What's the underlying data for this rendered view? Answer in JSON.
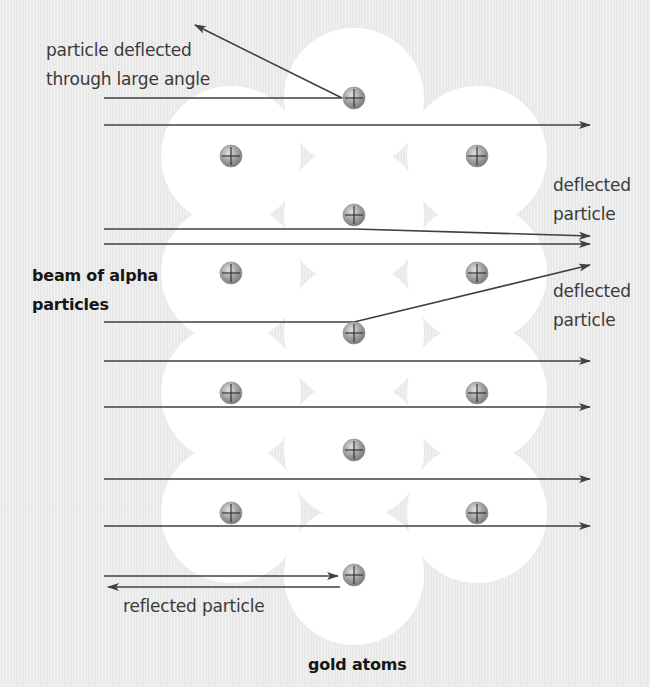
{
  "diagram": {
    "colors": {
      "background": "#e9e9e9",
      "atom_halo": "#ffffff",
      "nucleus_fill": "#9a9a9a",
      "nucleus_highlight": "#d8d8d8",
      "line": "#404040",
      "label_text": "#3a3a3a",
      "bold_label_text": "#161616"
    },
    "atom_radius": 70,
    "nucleus_radius": 11,
    "nucleus_symbol": "plus-sign",
    "atoms": [
      {
        "x": 354,
        "y": 98
      },
      {
        "x": 231,
        "y": 156
      },
      {
        "x": 477,
        "y": 156
      },
      {
        "x": 354,
        "y": 215
      },
      {
        "x": 231,
        "y": 273
      },
      {
        "x": 477,
        "y": 273
      },
      {
        "x": 354,
        "y": 333
      },
      {
        "x": 231,
        "y": 393
      },
      {
        "x": 477,
        "y": 393
      },
      {
        "x": 354,
        "y": 450
      },
      {
        "x": 231,
        "y": 513
      },
      {
        "x": 477,
        "y": 513
      },
      {
        "x": 354,
        "y": 575
      }
    ],
    "paths": [
      {
        "name": "large-angle-deflection",
        "points": [
          [
            104,
            98
          ],
          [
            342,
            98
          ],
          [
            195,
            25
          ]
        ],
        "arrow": "end"
      },
      {
        "name": "straight-path-1",
        "points": [
          [
            104,
            125
          ],
          [
            590,
            125
          ]
        ],
        "arrow": "end"
      },
      {
        "name": "small-deflection-1",
        "points": [
          [
            104,
            229
          ],
          [
            354,
            229
          ],
          [
            590,
            236
          ]
        ],
        "arrow": "end"
      },
      {
        "name": "straight-path-2",
        "points": [
          [
            104,
            244
          ],
          [
            590,
            244
          ]
        ],
        "arrow": "end"
      },
      {
        "name": "small-deflection-2",
        "points": [
          [
            104,
            322
          ],
          [
            354,
            322
          ],
          [
            590,
            265
          ]
        ],
        "arrow": "end"
      },
      {
        "name": "straight-path-3",
        "points": [
          [
            104,
            361
          ],
          [
            590,
            361
          ]
        ],
        "arrow": "end"
      },
      {
        "name": "straight-path-4",
        "points": [
          [
            104,
            407
          ],
          [
            590,
            407
          ]
        ],
        "arrow": "end"
      },
      {
        "name": "straight-path-5",
        "points": [
          [
            104,
            479
          ],
          [
            590,
            479
          ]
        ],
        "arrow": "end"
      },
      {
        "name": "straight-path-6",
        "points": [
          [
            104,
            526
          ],
          [
            590,
            526
          ]
        ],
        "arrow": "end"
      },
      {
        "name": "incoming-to-reflect",
        "points": [
          [
            104,
            576
          ],
          [
            338,
            576
          ]
        ],
        "arrow": "end"
      },
      {
        "name": "reflected-path",
        "points": [
          [
            340,
            587
          ],
          [
            108,
            587
          ]
        ],
        "arrow": "end"
      }
    ],
    "labels": {
      "large_angle_line1": "particle deflected",
      "large_angle_line2": "through large angle",
      "deflected1_line1": "deflected",
      "deflected1_line2": "particle",
      "deflected2_line1": "deflected",
      "deflected2_line2": "particle",
      "beam_line1": "beam of alpha",
      "beam_line2": "particles",
      "reflected": "reflected particle",
      "gold_atoms": "gold atoms"
    }
  }
}
